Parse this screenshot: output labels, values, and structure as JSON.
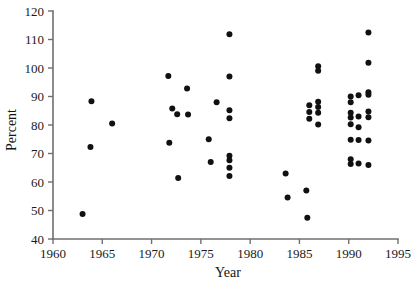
{
  "chart_data": {
    "type": "scatter",
    "title": "",
    "xlabel": "Year",
    "ylabel": "Percent",
    "xlim": [
      1960,
      1995
    ],
    "ylim": [
      40,
      120
    ],
    "xticks": [
      1960,
      1965,
      1970,
      1975,
      1980,
      1985,
      1990,
      1995
    ],
    "xtick_labels": [
      "1960",
      "1965",
      "1970",
      "1975",
      "1980",
      "1985",
      "1990",
      "1995"
    ],
    "yticks": [
      40,
      50,
      60,
      70,
      80,
      90,
      100,
      110,
      120
    ],
    "ytick_labels": [
      "40",
      "50",
      "60",
      "70",
      "80",
      "90",
      "100",
      "110",
      "120"
    ],
    "grid": false,
    "legend": null,
    "marker": "filled-circle",
    "marker_color": "#111111",
    "marker_size_px": 3.0,
    "n_points": 56,
    "points": [
      {
        "x": 1963.0,
        "y": 48.8
      },
      {
        "x": 1963.8,
        "y": 72.3
      },
      {
        "x": 1963.9,
        "y": 88.3
      },
      {
        "x": 1966.0,
        "y": 80.5
      },
      {
        "x": 1971.7,
        "y": 97.2
      },
      {
        "x": 1971.8,
        "y": 73.8
      },
      {
        "x": 1972.1,
        "y": 85.8
      },
      {
        "x": 1972.6,
        "y": 83.8
      },
      {
        "x": 1972.7,
        "y": 61.4
      },
      {
        "x": 1973.6,
        "y": 92.8
      },
      {
        "x": 1973.7,
        "y": 83.7
      },
      {
        "x": 1975.8,
        "y": 75.0
      },
      {
        "x": 1976.0,
        "y": 67.0
      },
      {
        "x": 1976.6,
        "y": 88.0
      },
      {
        "x": 1977.9,
        "y": 111.8
      },
      {
        "x": 1977.9,
        "y": 97.0
      },
      {
        "x": 1977.9,
        "y": 85.2
      },
      {
        "x": 1977.9,
        "y": 82.4
      },
      {
        "x": 1977.9,
        "y": 69.2
      },
      {
        "x": 1977.9,
        "y": 67.6
      },
      {
        "x": 1977.9,
        "y": 65.0
      },
      {
        "x": 1977.9,
        "y": 62.1
      },
      {
        "x": 1983.6,
        "y": 63.0
      },
      {
        "x": 1983.8,
        "y": 54.6
      },
      {
        "x": 1985.7,
        "y": 57.0
      },
      {
        "x": 1985.8,
        "y": 47.5
      },
      {
        "x": 1986.0,
        "y": 86.9
      },
      {
        "x": 1986.0,
        "y": 84.6
      },
      {
        "x": 1986.0,
        "y": 82.2
      },
      {
        "x": 1986.9,
        "y": 100.6
      },
      {
        "x": 1986.9,
        "y": 99.0
      },
      {
        "x": 1986.9,
        "y": 88.2
      },
      {
        "x": 1986.9,
        "y": 86.3
      },
      {
        "x": 1986.9,
        "y": 84.3
      },
      {
        "x": 1986.9,
        "y": 80.2
      },
      {
        "x": 1990.2,
        "y": 90.0
      },
      {
        "x": 1990.2,
        "y": 88.0
      },
      {
        "x": 1990.2,
        "y": 84.3
      },
      {
        "x": 1990.2,
        "y": 82.6
      },
      {
        "x": 1990.2,
        "y": 80.3
      },
      {
        "x": 1990.2,
        "y": 74.8
      },
      {
        "x": 1990.2,
        "y": 68.0
      },
      {
        "x": 1990.2,
        "y": 66.3
      },
      {
        "x": 1991.0,
        "y": 90.4
      },
      {
        "x": 1991.0,
        "y": 83.0
      },
      {
        "x": 1991.0,
        "y": 79.2
      },
      {
        "x": 1991.0,
        "y": 74.7
      },
      {
        "x": 1991.0,
        "y": 66.5
      },
      {
        "x": 1992.0,
        "y": 112.5
      },
      {
        "x": 1992.0,
        "y": 101.8
      },
      {
        "x": 1992.0,
        "y": 91.5
      },
      {
        "x": 1992.0,
        "y": 90.6
      },
      {
        "x": 1992.0,
        "y": 84.7
      },
      {
        "x": 1992.0,
        "y": 82.7
      },
      {
        "x": 1992.0,
        "y": 74.6
      },
      {
        "x": 1992.0,
        "y": 66.0
      }
    ]
  },
  "colors": {
    "marker": "#111111",
    "axis": "#6f6f6f",
    "text": "#141414",
    "background": "#ffffff"
  }
}
